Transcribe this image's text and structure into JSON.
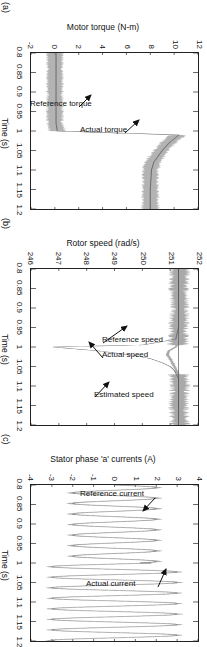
{
  "figure": {
    "orientation": "rotated-90-clockwise",
    "background": "#ffffff",
    "line_color_actual": "#9a9a9a",
    "line_color_reference": "#6f6f6f",
    "axis_color": "#222222"
  },
  "panels": [
    {
      "tag": "(a)",
      "ylabel": "Motor torque (N-m)",
      "xlabel": "Time (s)",
      "yticks": [
        "12",
        "10",
        "8",
        "6",
        "4",
        "2",
        "0",
        "-2"
      ],
      "xticks": [
        "0.8",
        "0.85",
        "0.9",
        "0.95",
        "1",
        "1.05",
        "1.1",
        "1.15",
        "1.2"
      ],
      "annotations": [
        {
          "text": "Actual torque"
        },
        {
          "text": "Reference torque"
        }
      ]
    },
    {
      "tag": "(b)",
      "ylabel": "Rotor speed (rad/s)",
      "xlabel": "Time (s)",
      "yticks": [
        "252",
        "251",
        "250",
        "249",
        "248",
        "247",
        "246"
      ],
      "xticks": [
        "0.8",
        "0.85",
        "0.9",
        "0.95",
        "1",
        "1.05",
        "1.1",
        "1.15",
        "1.2"
      ],
      "annotations": [
        {
          "text": "Reference speed"
        },
        {
          "text": "Actual speed"
        },
        {
          "text": "Estimated speed"
        }
      ]
    },
    {
      "tag": "(c)",
      "ylabel": "Stator phase 'a' currents (A)",
      "xlabel": "Time (s)",
      "yticks": [
        "4",
        "3",
        "2",
        "1",
        "0",
        "-1",
        "-2",
        "-3",
        "-4"
      ],
      "xticks": [
        "0.8",
        "0.85",
        "0.9",
        "0.95",
        "1",
        "1.05",
        "1.1",
        "1.15",
        "1.2"
      ],
      "annotations": [
        {
          "text": "Reference current"
        },
        {
          "text": "Actual current"
        }
      ]
    }
  ],
  "chart_data": [
    {
      "type": "line",
      "title": "(a)",
      "xlabel": "Time (s)",
      "ylabel": "Motor torque (N-m)",
      "xlim": [
        0.8,
        1.2
      ],
      "ylim": [
        -2,
        12
      ],
      "xticks": [
        0.8,
        0.85,
        0.9,
        0.95,
        1,
        1.05,
        1.1,
        1.15,
        1.2
      ],
      "yticks": [
        -2,
        0,
        2,
        4,
        6,
        8,
        10,
        12
      ],
      "grid": false,
      "legend": "annotations-in-plot",
      "series": [
        {
          "name": "Reference torque",
          "note": "smooth trace; ~0.1 N-m before t=1 s, ramps to peak ~10.4 N-m at t~1.01 s then settles ~8.0 N-m",
          "x": [
            0.8,
            0.85,
            0.9,
            0.95,
            0.98,
            1.0,
            1.005,
            1.01,
            1.02,
            1.03,
            1.05,
            1.08,
            1.1,
            1.15,
            1.2
          ],
          "values": [
            0.1,
            0.1,
            0.1,
            0.1,
            0.1,
            0.2,
            5.0,
            10.4,
            10.0,
            9.6,
            9.0,
            8.3,
            8.1,
            8.0,
            8.0
          ]
        },
        {
          "name": "Actual torque",
          "note": "noisy/hysteresis band trace following reference; ripple band ~±0.5 N-m",
          "x": [
            0.8,
            0.85,
            0.9,
            0.95,
            0.98,
            1.0,
            1.005,
            1.01,
            1.02,
            1.03,
            1.05,
            1.08,
            1.1,
            1.15,
            1.2
          ],
          "values": [
            0.0,
            0.0,
            0.0,
            0.0,
            0.0,
            0.2,
            5.2,
            10.3,
            9.9,
            9.5,
            8.9,
            8.2,
            8.0,
            8.0,
            8.0
          ]
        }
      ]
    },
    {
      "type": "line",
      "title": "(b)",
      "xlabel": "Time (s)",
      "ylabel": "Rotor speed (rad/s)",
      "xlim": [
        0.8,
        1.2
      ],
      "ylim": [
        246,
        252
      ],
      "xticks": [
        0.8,
        0.85,
        0.9,
        0.95,
        1,
        1.05,
        1.1,
        1.15,
        1.2
      ],
      "yticks": [
        246,
        247,
        248,
        249,
        250,
        251,
        252
      ],
      "grid": false,
      "legend": "annotations-in-plot",
      "series": [
        {
          "name": "Reference speed",
          "note": "flat constant line at 251.3 rad/s",
          "x": [
            0.8,
            1.2
          ],
          "values": [
            251.3,
            251.3
          ]
        },
        {
          "name": "Actual speed",
          "note": "noisy band around 251.3 rad/s, dips to ~250.8 at load step t=1 s, recovers by t~1.06 s",
          "x": [
            0.8,
            0.85,
            0.9,
            0.95,
            0.99,
            1.0,
            1.01,
            1.02,
            1.03,
            1.05,
            1.07,
            1.1,
            1.15,
            1.2
          ],
          "values": [
            251.35,
            251.3,
            251.35,
            251.3,
            251.3,
            251.2,
            250.95,
            250.9,
            251.0,
            251.15,
            251.3,
            251.35,
            251.3,
            251.35
          ]
        },
        {
          "name": "Estimated speed",
          "note": "smooth trace; large transient dip to ~246.8 rad/s at t=1.0 s, converges back by t~1.07 s",
          "x": [
            0.8,
            0.9,
            0.95,
            0.98,
            0.995,
            1.0,
            1.005,
            1.01,
            1.02,
            1.03,
            1.04,
            1.05,
            1.06,
            1.08,
            1.1,
            1.2
          ],
          "values": [
            251.3,
            251.3,
            251.3,
            251.2,
            250.0,
            246.8,
            247.6,
            248.4,
            249.6,
            250.3,
            250.7,
            251.0,
            251.15,
            251.3,
            251.3,
            251.3
          ]
        }
      ]
    },
    {
      "type": "line",
      "title": "(c)",
      "xlabel": "Time (s)",
      "ylabel": "Stator phase 'a' currents (A)",
      "xlim": [
        0.8,
        1.2
      ],
      "ylim": [
        -4,
        4
      ],
      "xticks": [
        0.8,
        0.85,
        0.9,
        0.95,
        1,
        1.05,
        1.1,
        1.15,
        1.2
      ],
      "yticks": [
        -4,
        -3,
        -2,
        -1,
        0,
        1,
        2,
        3,
        4
      ],
      "grid": false,
      "legend": "annotations-in-plot",
      "series": [
        {
          "name": "Reference current",
          "note": "sinusoid, frequency ~37 Hz; amplitude ~2.0 A before t=1.0 s, ~3.0 A after load step",
          "amplitude_before_step": 2.0,
          "amplitude_after_step": 3.0,
          "step_time": 1.0,
          "frequency_hz": 37
        },
        {
          "name": "Actual current",
          "note": "hysteresis-band sinusoid tracking the reference; amplitude ~2.1 A before t=1.0 s, ~3.1 A after",
          "amplitude_before_step": 2.1,
          "amplitude_after_step": 3.1,
          "step_time": 1.0,
          "frequency_hz": 37
        }
      ]
    }
  ]
}
